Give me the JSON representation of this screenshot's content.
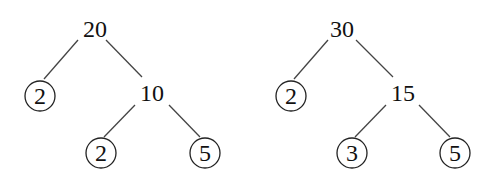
{
  "trees": [
    {
      "root": "20",
      "left_leaf": "2",
      "inner": "10",
      "inner_left_leaf": "2",
      "inner_right_leaf": "5"
    },
    {
      "root": "30",
      "left_leaf": "2",
      "inner": "15",
      "inner_left_leaf": "3",
      "inner_right_leaf": "5"
    }
  ],
  "colors": {
    "line": "#444444",
    "text": "#111111",
    "background": "#ffffff"
  }
}
